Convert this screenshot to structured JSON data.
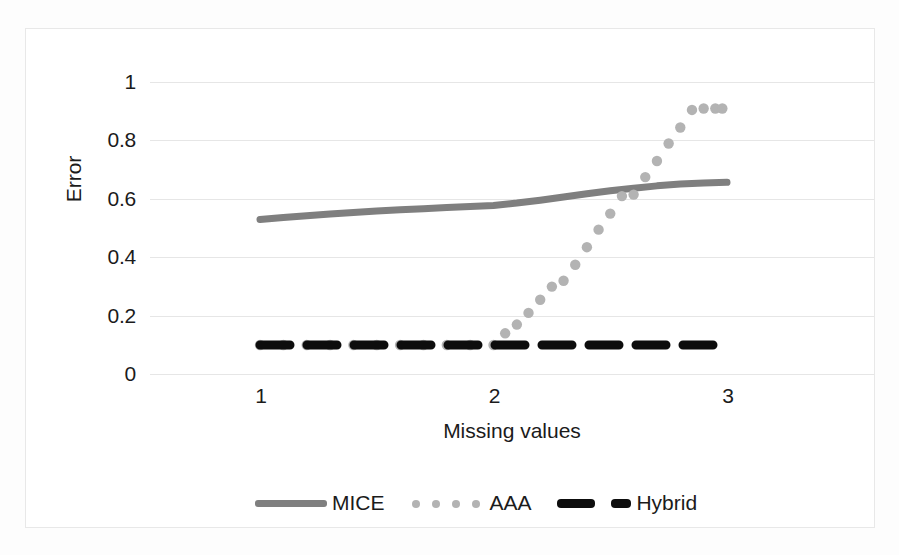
{
  "chart_data": {
    "type": "line",
    "title": "",
    "xlabel": "Missing values",
    "ylabel": "Error",
    "xlim": [
      1,
      3
    ],
    "ylim": [
      0,
      1
    ],
    "xticks": [
      "1",
      "2",
      "3"
    ],
    "xtick_values": [
      1,
      2,
      3
    ],
    "yticks": [
      "0",
      "0.2",
      "0.4",
      "0.6",
      "0.8",
      "1"
    ],
    "ytick_values": [
      0,
      0.2,
      0.4,
      0.6,
      0.8,
      1
    ],
    "grid": "horizontal",
    "legend_position": "bottom",
    "series": [
      {
        "name": "MICE",
        "style": "solid-thick",
        "color": "#7f7f7f",
        "x": [
          1.0,
          1.1,
          1.2,
          1.3,
          1.4,
          1.5,
          1.6,
          1.7,
          1.8,
          1.9,
          2.0,
          2.1,
          2.2,
          2.3,
          2.4,
          2.5,
          2.6,
          2.7,
          2.8,
          2.9,
          3.0
        ],
        "values": [
          0.43,
          0.437,
          0.443,
          0.449,
          0.454,
          0.459,
          0.463,
          0.467,
          0.471,
          0.474,
          0.478,
          0.486,
          0.496,
          0.507,
          0.518,
          0.528,
          0.537,
          0.545,
          0.551,
          0.555,
          0.557
        ]
      },
      {
        "name": "AAA",
        "style": "dotted",
        "color": "#b3b3b3",
        "x": [
          1.0,
          1.1,
          1.2,
          1.3,
          1.4,
          1.5,
          1.6,
          1.7,
          1.8,
          1.9,
          2.0,
          2.05,
          2.1,
          2.15,
          2.2,
          2.25,
          2.3,
          2.35,
          2.4,
          2.45,
          2.5,
          2.55,
          2.6,
          2.65,
          2.7,
          2.75,
          2.8,
          2.85,
          2.9,
          2.95,
          2.98
        ],
        "values": [
          0.0,
          0.0,
          0.0,
          0.0,
          0.0,
          0.0,
          0.0,
          0.0,
          0.0,
          0.0,
          0.0,
          0.04,
          0.07,
          0.11,
          0.155,
          0.2,
          0.22,
          0.275,
          0.335,
          0.395,
          0.45,
          0.51,
          0.515,
          0.575,
          0.63,
          0.69,
          0.745,
          0.805,
          0.81,
          0.81,
          0.81
        ]
      },
      {
        "name": "Hybrid",
        "style": "dashed-thick",
        "color": "#0d0d0d",
        "x": [
          1.0,
          1.1,
          1.2,
          1.3,
          1.4,
          1.5,
          1.6,
          1.7,
          1.8,
          1.9,
          2.0,
          2.1,
          2.2,
          2.3,
          2.4,
          2.5,
          2.6,
          2.7,
          2.8,
          2.9,
          3.0
        ],
        "values": [
          0,
          0,
          0,
          0,
          0,
          0,
          0,
          0,
          0,
          0,
          0,
          0,
          0,
          0,
          0,
          0,
          0,
          0,
          0,
          0,
          0
        ]
      }
    ]
  },
  "legend": {
    "items": [
      {
        "label": "MICE",
        "swatch": "solid-line-swatch"
      },
      {
        "label": "AAA",
        "swatch": "dotted-line-swatch"
      },
      {
        "label": "Hybrid",
        "swatch": "dashed-line-swatch"
      }
    ]
  },
  "colors": {
    "mice": "#7f7f7f",
    "aaa": "#b3b3b3",
    "hybrid": "#0d0d0d",
    "gridline": "#e6e6e6",
    "frame": "#e8e8e8",
    "text": "#1b1b1b"
  }
}
